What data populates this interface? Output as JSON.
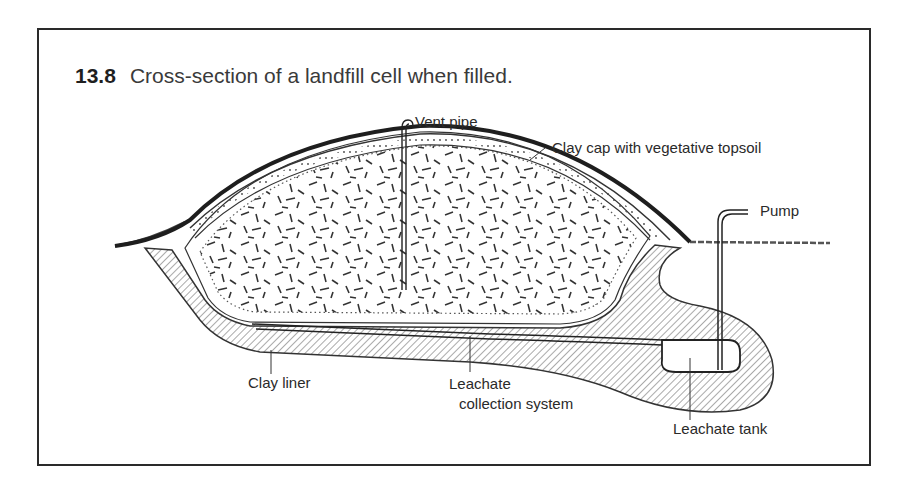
{
  "figure": {
    "number": "13.8",
    "caption": "Cross-section of a landfill cell when filled."
  },
  "labels": {
    "vent_pipe": "Vent pipe",
    "clay_cap": "Clay cap with vegetative topsoil",
    "pump": "Pump",
    "clay_liner": "Clay liner",
    "leachate_line1": "Leachate",
    "leachate_line2": "collection system",
    "leachate_tank": "Leachate tank"
  },
  "colors": {
    "ink": "#2a2a2a",
    "background": "#ffffff"
  }
}
